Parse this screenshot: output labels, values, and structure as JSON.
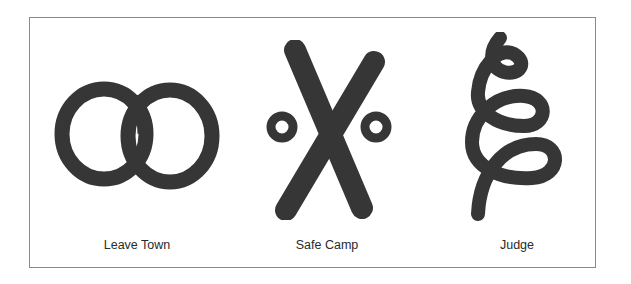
{
  "figure": {
    "ink_color": "#363636",
    "border_color": "#8a8a8a",
    "symbols": [
      {
        "id": "leave-town",
        "label": "Leave Town",
        "shape": "two-interlocking-rings"
      },
      {
        "id": "safe-camp",
        "label": "Safe Camp",
        "shape": "x-with-two-small-circles"
      },
      {
        "id": "judge",
        "label": "Judge",
        "shape": "vertical-spiral-loops"
      }
    ]
  }
}
